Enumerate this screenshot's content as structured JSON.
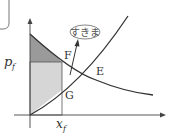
{
  "diagram": {
    "type": "supply-demand",
    "labels": {
      "price": "p",
      "price_sub": "f",
      "quantity": "x",
      "quantity_sub": "f",
      "point_f": "F",
      "point_e": "E",
      "point_g": "G",
      "callout": "すきま"
    },
    "colors": {
      "line": "#333333",
      "dark_area": "#9a9a9a",
      "light_area": "#d6d6d6",
      "box_border": "#777777"
    }
  }
}
